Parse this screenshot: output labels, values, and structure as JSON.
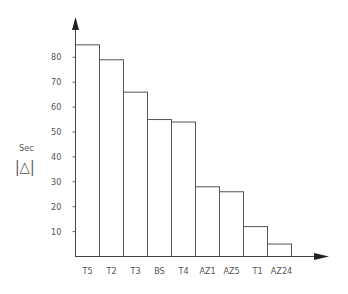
{
  "chart_data": {
    "type": "bar",
    "title": "",
    "xlabel": "",
    "ylabel": "Sec",
    "ylabel_symbol": "|△|",
    "categories": [
      "T5",
      "T2",
      "T3",
      "BS",
      "T4",
      "AZ1",
      "AZ5",
      "T1",
      "AZ24"
    ],
    "values": [
      85,
      79,
      66,
      55,
      54,
      28,
      26,
      12,
      5
    ],
    "ylim": [
      0,
      90
    ],
    "yticks": [
      10,
      20,
      30,
      40,
      50,
      60,
      70,
      80
    ],
    "grid": false,
    "legend": "none",
    "colors": {
      "bar_fill": "#ffffff",
      "bar_stroke": "#555555",
      "axis": "#444444",
      "text": "#555555"
    }
  }
}
